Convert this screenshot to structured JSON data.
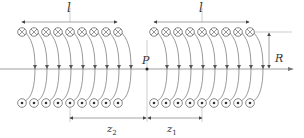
{
  "diagram": {
    "labels": {
      "length_left": "l",
      "length_right": "l",
      "point": "P",
      "radius": "R",
      "z2": "z",
      "z2_sub": "2",
      "z1": "z",
      "z1_sub": "1"
    },
    "coils": {
      "turns_per_solenoid": 9,
      "top_symbol": "current-into-page (⊗)",
      "bottom_symbol": "current-out-of-page (⊙)"
    },
    "colors": {
      "line": "#555555",
      "text": "#333333",
      "background": "#ffffff"
    }
  }
}
